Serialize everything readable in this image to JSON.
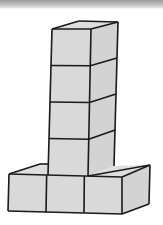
{
  "figure": {
    "tower_cubes": 4,
    "base_cubes": 3,
    "total_visible_cubes": 7,
    "face_color": "#d9d9d9",
    "edge_color": "#1a1a1a"
  }
}
